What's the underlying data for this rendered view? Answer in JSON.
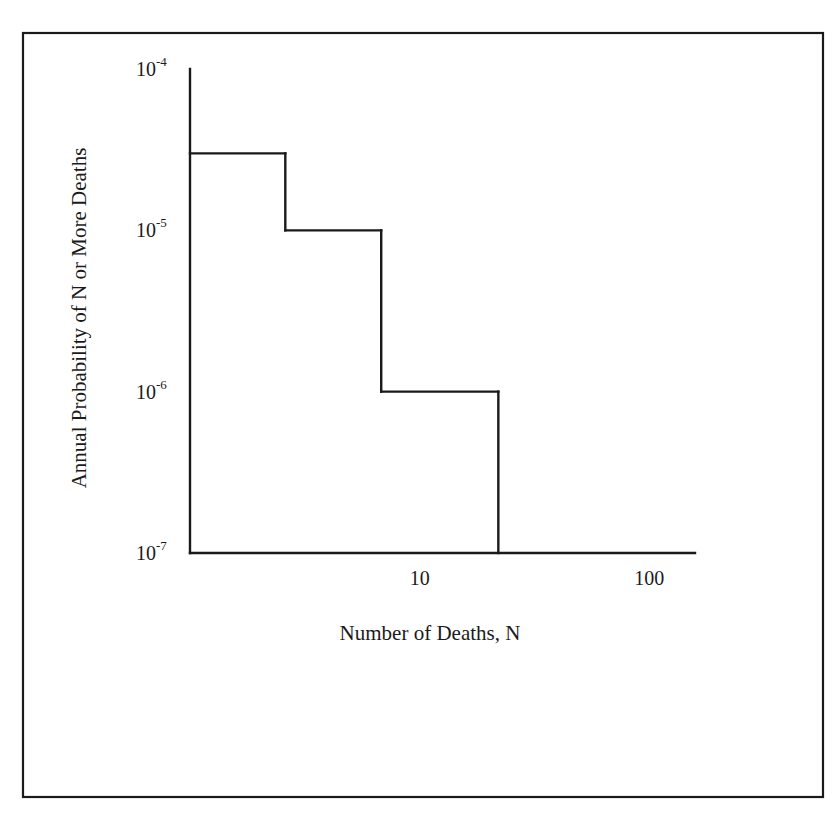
{
  "chart_data": {
    "type": "line",
    "subtype": "step",
    "title": "",
    "xlabel": "Number of Deaths, N",
    "ylabel": "Annual Probability of N or More Deaths",
    "x_scale": "log",
    "y_scale": "log",
    "xlim": [
      1,
      158
    ],
    "ylim": [
      1e-07,
      0.0001
    ],
    "grid": false,
    "legend": "none",
    "x_ticks": [
      {
        "value": 10,
        "label": "10"
      },
      {
        "value": 100,
        "label": "100"
      }
    ],
    "y_ticks": [
      {
        "value": 0.0001,
        "base": "10",
        "exp": "-4"
      },
      {
        "value": 1e-05,
        "base": "10",
        "exp": "-5"
      },
      {
        "value": 1e-06,
        "base": "10",
        "exp": "-6"
      },
      {
        "value": 1e-07,
        "base": "10",
        "exp": "-7"
      }
    ],
    "series": [
      {
        "name": "F-N curve",
        "steps": [
          {
            "n_from": 1,
            "n_to": 2.6,
            "probability": 3e-05
          },
          {
            "n_from": 2.6,
            "n_to": 6.8,
            "probability": 1e-05
          },
          {
            "n_from": 6.8,
            "n_to": 22,
            "probability": 1e-06
          }
        ],
        "drop_to": 1e-07
      }
    ]
  }
}
